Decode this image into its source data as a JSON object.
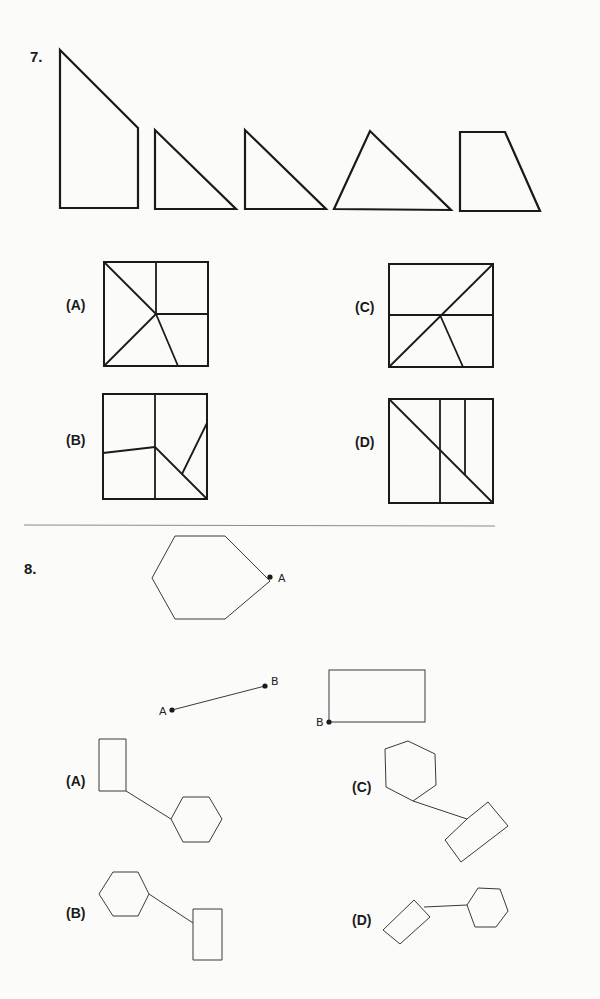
{
  "q7": {
    "number": "7.",
    "pieces": [
      {
        "name": "piece-pentagon",
        "points": "60,50 138,128 138,208 60,208"
      },
      {
        "name": "piece-right-triangle-1",
        "points": "155,130 155,209 236,209"
      },
      {
        "name": "piece-right-triangle-2",
        "points": "245,130 245,209 326,209"
      },
      {
        "name": "piece-scalene-triangle",
        "points": "334,209 370,131 451,210"
      },
      {
        "name": "piece-trapezoid",
        "points": "460,132 505,132 540,211 460,211"
      }
    ],
    "options": [
      {
        "label": "(A)",
        "lx": 66,
        "ly": 306,
        "box": [
          104,
          262,
          104,
          104
        ],
        "lines": [
          [
            104,
            262,
            156,
            314
          ],
          [
            156,
            262,
            156,
            314
          ],
          [
            156,
            314,
            208,
            314
          ],
          [
            104,
            366,
            156,
            314
          ],
          [
            156,
            314,
            178,
            366
          ]
        ]
      },
      {
        "label": "(B)",
        "lx": 66,
        "ly": 441,
        "box": [
          103,
          394,
          104,
          105
        ],
        "lines": [
          [
            155,
            394,
            155,
            499
          ],
          [
            103,
            453,
            155,
            447
          ],
          [
            155,
            447,
            207,
            499
          ],
          [
            182,
            474,
            207,
            423
          ]
        ]
      },
      {
        "label": "(C)",
        "lx": 355,
        "ly": 308,
        "box": [
          389,
          264,
          104,
          103
        ],
        "lines": [
          [
            389,
            367,
            493,
            264
          ],
          [
            389,
            315,
            493,
            315
          ],
          [
            440,
            315,
            463,
            367
          ]
        ]
      },
      {
        "label": "(D)",
        "lx": 355,
        "ly": 443,
        "box": [
          389,
          399,
          104,
          104
        ],
        "lines": [
          [
            389,
            399,
            493,
            503
          ],
          [
            440,
            399,
            440,
            503
          ],
          [
            465,
            399,
            465,
            475
          ]
        ]
      }
    ]
  },
  "separator": {
    "x1": 24,
    "y1": 525,
    "x2": 495,
    "y2": 526
  },
  "q8": {
    "number": "8.",
    "hexagon": {
      "points": "175,536 225,536 270,581 225,619 175,619 152,578"
    },
    "point_a": {
      "x": 270,
      "y": 577,
      "label": "A"
    },
    "segment": {
      "x1": 172,
      "y1": 710,
      "x2": 265,
      "y2": 686,
      "label_a": "A",
      "label_b": "B"
    },
    "rectangle": {
      "x": 329,
      "y": 670,
      "w": 96,
      "h": 52,
      "label": "B"
    },
    "options": [
      {
        "label": "(A)",
        "lx": 66,
        "ly": 782,
        "rect": "99,739 126,739 126,791 99,791",
        "link": [
          126,
          791,
          171,
          819
        ],
        "hex": "171,819 183,797 209,797 222,819 209,842 183,842"
      },
      {
        "label": "(C)",
        "lx": 352,
        "ly": 788,
        "hex": "385,749 408,741 435,754 436,785 413,801 386,787",
        "link": [
          413,
          801,
          467,
          819
        ],
        "rect": "467,819 488,802 508,826 461,862 445,840"
      },
      {
        "label": "(B)",
        "lx": 66,
        "ly": 914,
        "hex": "99,894 113,872 138,872 149,894 138,916 113,916",
        "link": [
          149,
          894,
          193,
          923
        ],
        "rect": "193,909 222,909 222,960 193,960"
      },
      {
        "label": "(D)",
        "lx": 352,
        "ly": 921,
        "rect": "383,930 414,900 430,917 400,944",
        "link": [
          424,
          907,
          467,
          905
        ],
        "hex": "467,905 478,888 500,889 508,911 496,927 475,927"
      }
    ]
  },
  "colors": {
    "ink": "#1a1a1a",
    "thin": "#3a3a3a",
    "paper": "#fbfbfa"
  }
}
